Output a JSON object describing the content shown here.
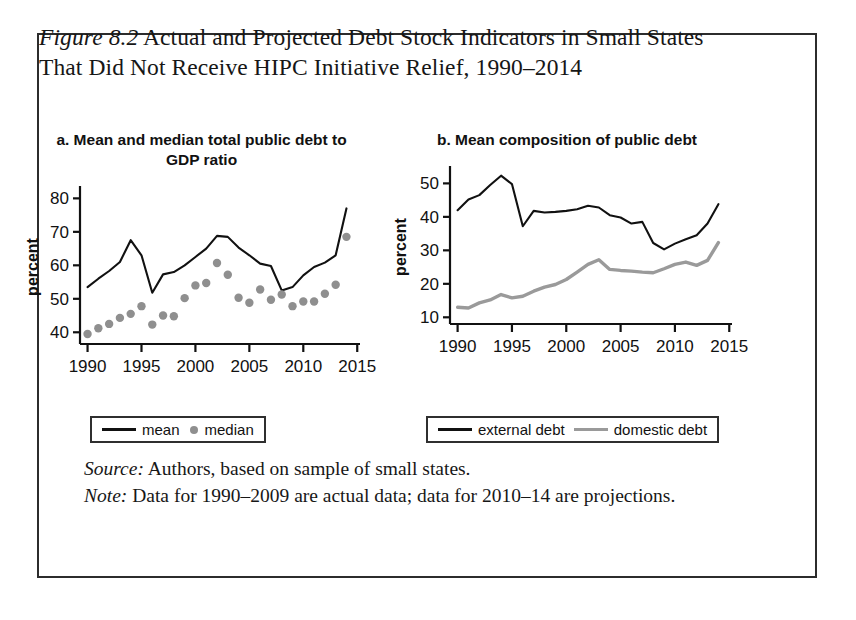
{
  "figure": {
    "label": "Figure 8.2",
    "caption": " Actual and Projected Debt Stock Indicators in Small States That Did Not Receive HIPC Initiative Relief, 1990–2014",
    "source_lead": "Source:",
    "source_text": " Authors, based on sample of small states.",
    "note_lead": "Note:",
    "note_text": " Data for 1990–2009 are actual data; data for 2010–14 are projections."
  },
  "colors": {
    "line_black": "#111111",
    "line_gray": "#9a9a9a",
    "dot_gray": "#8f8f8f",
    "frame": "#2c2c2c"
  },
  "legends": {
    "panel_a": [
      {
        "label": "mean",
        "marker": "line-black"
      },
      {
        "label": "median",
        "marker": "dot-gray"
      }
    ],
    "panel_b": [
      {
        "label": "external debt",
        "marker": "line-black"
      },
      {
        "label": "domestic debt",
        "marker": "line-gray"
      }
    ]
  },
  "chart_data": [
    {
      "id": "panel-a",
      "type": "line",
      "title": "a. Mean and median total public debt to GDP ratio",
      "xlabel": "",
      "ylabel": "percent",
      "xlim": [
        1989.3,
        2014.7
      ],
      "ylim": [
        36.5,
        82.5
      ],
      "xticks": [
        1990,
        1995,
        2000,
        2005,
        2010,
        2015
      ],
      "yticks": [
        40,
        50,
        60,
        70,
        80
      ],
      "grid": false,
      "legend_position": "below",
      "x": [
        1990,
        1991,
        1992,
        1993,
        1994,
        1995,
        1996,
        1997,
        1998,
        1999,
        2000,
        2001,
        2002,
        2003,
        2004,
        2005,
        2006,
        2007,
        2008,
        2009,
        2010,
        2011,
        2012,
        2013,
        2014
      ],
      "series": [
        {
          "name": "mean",
          "style": "line",
          "color": "#111111",
          "values": [
            53.5,
            56.0,
            58.3,
            61.0,
            67.5,
            63.0,
            51.8,
            57.3,
            58.0,
            60.0,
            62.5,
            65.0,
            68.8,
            68.5,
            65.3,
            63.0,
            60.5,
            59.8,
            52.5,
            53.5,
            57.0,
            59.5,
            60.8,
            63.0,
            77.0
          ]
        },
        {
          "name": "median",
          "style": "dots",
          "color": "#8f8f8f",
          "values": [
            39.5,
            41.2,
            42.5,
            44.3,
            45.5,
            47.8,
            42.3,
            45.0,
            44.8,
            50.2,
            54.0,
            54.7,
            60.7,
            57.2,
            50.3,
            48.8,
            52.8,
            49.7,
            51.3,
            47.8,
            49.2,
            49.2,
            51.5,
            54.2,
            68.5
          ]
        }
      ]
    },
    {
      "id": "panel-b",
      "type": "line",
      "title": "b. Mean composition of public debt",
      "xlabel": "",
      "ylabel": "percent",
      "xlim": [
        1989.3,
        2014.7
      ],
      "ylim": [
        8.0,
        54.0
      ],
      "xticks": [
        1990,
        1995,
        2000,
        2005,
        2010,
        2015
      ],
      "yticks": [
        10,
        20,
        30,
        40,
        50
      ],
      "grid": false,
      "legend_position": "below",
      "x": [
        1990,
        1991,
        1992,
        1993,
        1994,
        1995,
        1996,
        1997,
        1998,
        1999,
        2000,
        2001,
        2002,
        2003,
        2004,
        2005,
        2006,
        2007,
        2008,
        2009,
        2010,
        2011,
        2012,
        2013,
        2014
      ],
      "series": [
        {
          "name": "external debt",
          "style": "line",
          "color": "#111111",
          "values": [
            42.0,
            45.2,
            46.5,
            49.5,
            52.3,
            49.8,
            37.2,
            41.8,
            41.3,
            41.5,
            41.8,
            42.3,
            43.3,
            42.8,
            40.5,
            39.8,
            38.0,
            38.5,
            32.2,
            30.3,
            32.0,
            33.3,
            34.5,
            38.0,
            43.8
          ]
        },
        {
          "name": "domestic debt",
          "style": "line",
          "color": "#9a9a9a",
          "values": [
            13.0,
            12.8,
            14.3,
            15.2,
            16.8,
            15.8,
            16.3,
            17.8,
            19.0,
            19.8,
            21.3,
            23.5,
            25.8,
            27.2,
            24.3,
            24.0,
            23.8,
            23.5,
            23.3,
            24.5,
            25.8,
            26.5,
            25.5,
            27.0,
            32.3
          ]
        }
      ]
    }
  ]
}
